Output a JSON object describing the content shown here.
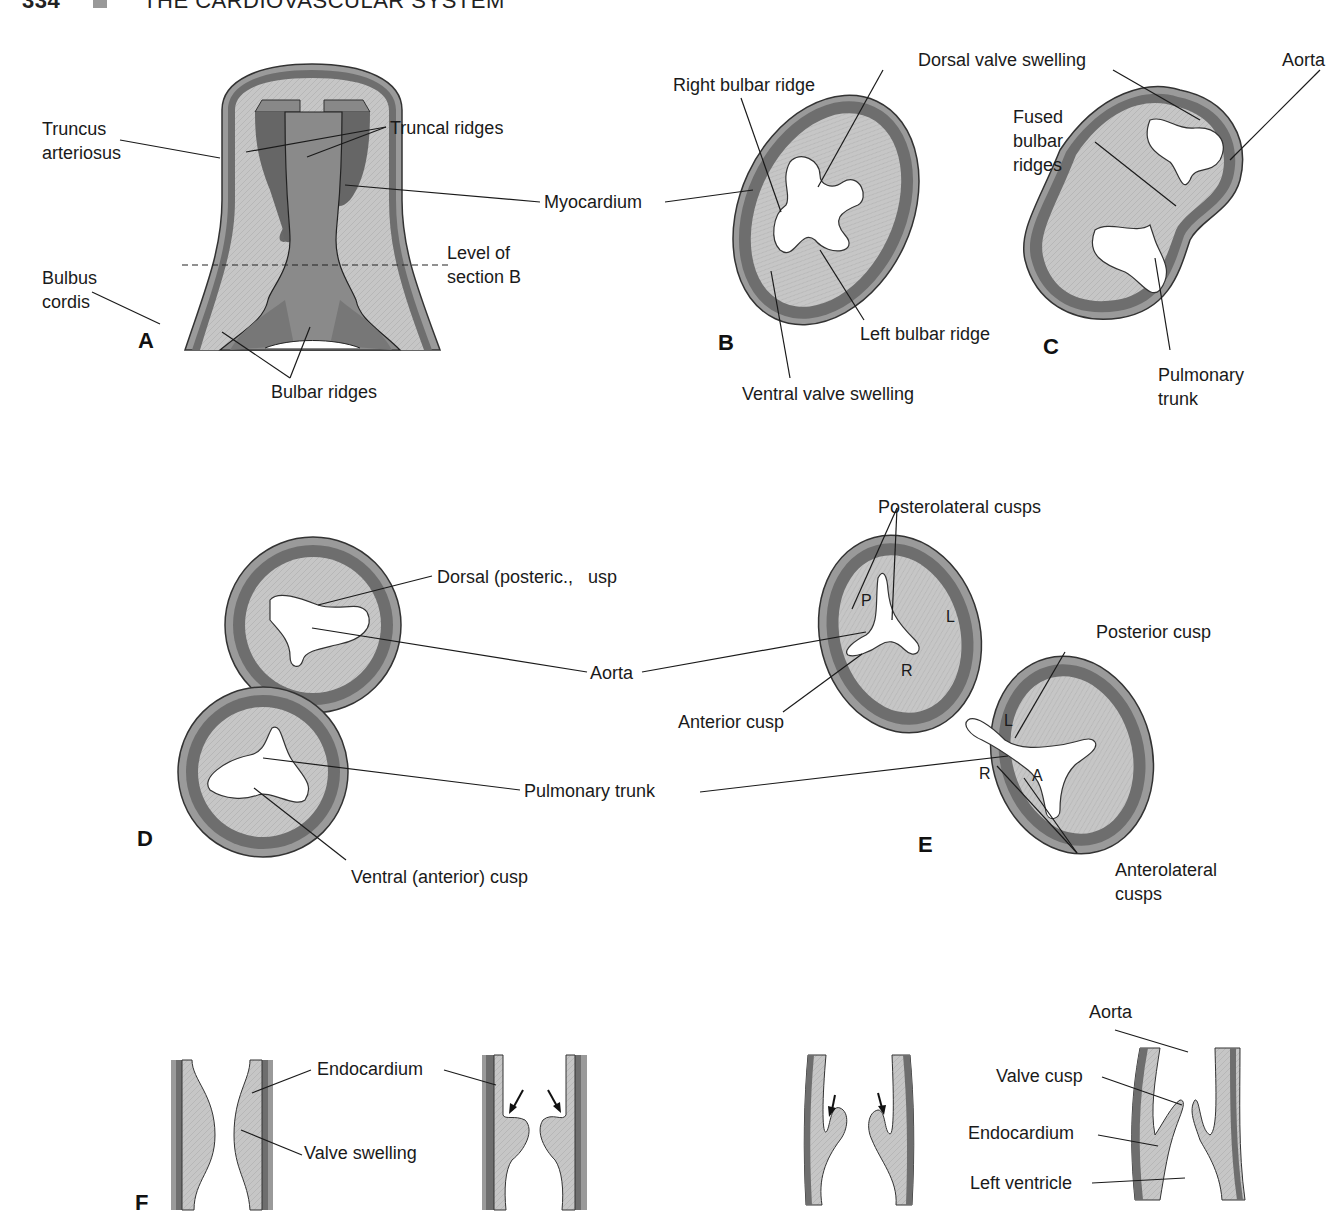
{
  "header": {
    "page_number": "334",
    "section_title": "THE CARDIOVASCULAR SYSTEM"
  },
  "panels": {
    "A": {
      "letter": "A",
      "labels": {
        "truncus_arteriosus": "Truncus\narteriosus",
        "truncal_ridges": "Truncal ridges",
        "myocardium": "Myocardium",
        "level_of_section_b": "Level of\nsection B",
        "bulbus_cordis": "Bulbus\ncordis",
        "bulbar_ridges": "Bulbar ridges"
      }
    },
    "B": {
      "letter": "B",
      "labels": {
        "right_bulbar_ridge": "Right bulbar ridge",
        "dorsal_valve_swelling": "Dorsal valve swelling",
        "left_bulbar_ridge": "Left bulbar ridge",
        "ventral_valve_swelling": "Ventral valve swelling"
      }
    },
    "C": {
      "letter": "C",
      "labels": {
        "aorta": "Aorta",
        "fused_bulbar_ridges": "Fused\nbulbar\nridges",
        "pulmonary_trunk": "Pulmonary\ntrunk"
      }
    },
    "D": {
      "letter": "D",
      "labels": {
        "dorsal_posterior_cusp": "Dorsal (posteric.,   usp",
        "aorta": "Aorta",
        "pulmonary_trunk": "Pulmonary trunk",
        "ventral_anterior_cusp": "Ventral (anterior) cusp"
      }
    },
    "E": {
      "letter": "E",
      "labels": {
        "posterolateral_cusps": "Posterolateral cusps",
        "anterior_cusp": "Anterior cusp",
        "posterior_cusp": "Posterior cusp",
        "anterolateral_cusps": "Anterolateral\ncusps"
      },
      "aortic_cusp_letters": [
        "P",
        "L",
        "R"
      ],
      "pulmonary_cusp_letters": [
        "L",
        "R",
        "A"
      ]
    },
    "F": {
      "letter": "F",
      "labels": {
        "endocardium_1": "Endocardium",
        "valve_swelling": "Valve swelling",
        "aorta": "Aorta",
        "valve_cusp": "Valve cusp",
        "endocardium_2": "Endocardium",
        "left_ventricle": "Left ventricle"
      }
    }
  },
  "colors": {
    "tissue_fill": "#c4c4c4",
    "myocardium_band": "#6e6e6e",
    "outer_wall": "#9a9a9a",
    "lumen": "#ffffff",
    "lumen_dark": "#808080",
    "leader_lines": "#1a1a1a"
  }
}
